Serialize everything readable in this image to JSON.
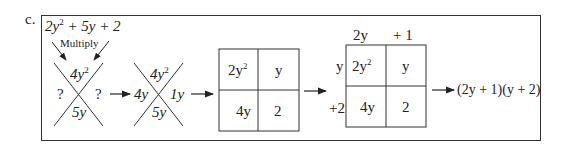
{
  "part_label": "c.",
  "expression": {
    "text_prefix": "2y",
    "sup1": "2",
    "rest": " + 5y + 2"
  },
  "multiply_label": "Multiply",
  "x1": {
    "top": "4y",
    "top_sup": "2",
    "left": "?",
    "right": "?",
    "bottom": "5y"
  },
  "x2": {
    "top": "4y",
    "top_sup": "2",
    "left": "4y",
    "right": "1y",
    "bottom": "5y"
  },
  "grid1": {
    "cells": [
      {
        "text": "2y",
        "sup": "2"
      },
      {
        "text": "y",
        "sup": ""
      },
      {
        "text": "4y",
        "sup": ""
      },
      {
        "text": "2",
        "sup": ""
      }
    ]
  },
  "grid2": {
    "top_labels": [
      "2y",
      "+ 1"
    ],
    "side_labels": [
      "y",
      "+2"
    ],
    "cells": [
      {
        "text": "2y",
        "sup": "2"
      },
      {
        "text": "y",
        "sup": ""
      },
      {
        "text": "4y",
        "sup": ""
      },
      {
        "text": "2",
        "sup": ""
      }
    ]
  },
  "result": "(2y + 1)(y + 2)"
}
